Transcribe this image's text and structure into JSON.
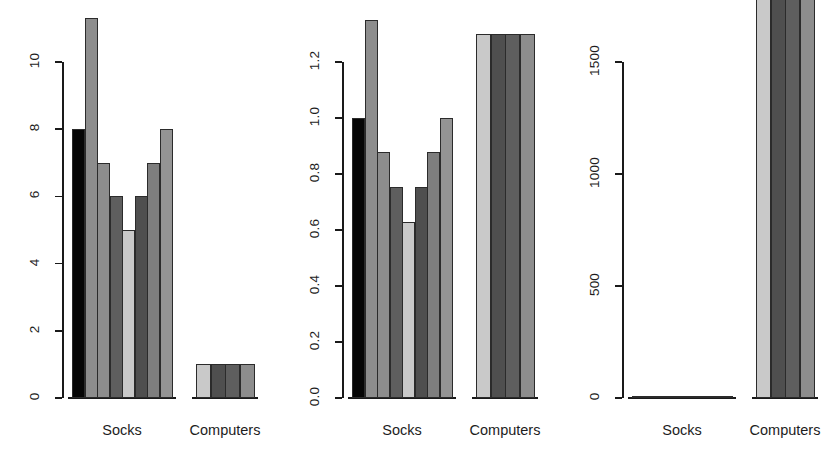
{
  "figure": {
    "type": "multi-panel-bar-chart",
    "panel_count": 3,
    "background": "#ffffff",
    "bar_border_color": "#2b2b2b",
    "axis_color": "#1a1a1a",
    "text_color": "#1d1d1d"
  },
  "categories": [
    "Socks",
    "Computers"
  ],
  "palette": {
    "black": "#060606",
    "gray_mid": "#8d8d8d",
    "gray_light": "#b9b9b9",
    "gray_dark": "#5e5e5e",
    "gray_pale": "#c9c9c9",
    "gray_darker": "#4f4f4f",
    "gray_medium2": "#7e7e7e",
    "gray_medium3": "#949494"
  },
  "chart_data": [
    {
      "id": "panel-1",
      "type": "bar",
      "title": "",
      "xlabel": "",
      "ylabel": "",
      "grid": false,
      "legend": "none",
      "ylim": [
        0,
        11.6
      ],
      "yticks": [
        0,
        2,
        4,
        6,
        8,
        10
      ],
      "ytick_labels": [
        "0",
        "2",
        "4",
        "6",
        "8",
        "10"
      ],
      "categories": [
        "Socks",
        "Computers"
      ],
      "groups": [
        {
          "category": "Socks",
          "values": [
            8,
            11.3,
            7,
            6,
            5,
            6,
            7,
            8
          ],
          "colors": [
            "#060606",
            "#8d8d8d",
            "#8d8d8d",
            "#5e5e5e",
            "#c9c9c9",
            "#4f4f4f",
            "#7e7e7e",
            "#949494"
          ]
        },
        {
          "category": "Computers",
          "values": [
            1,
            1,
            1,
            1
          ],
          "colors": [
            "#c9c9c9",
            "#4f4f4f",
            "#5e5e5e",
            "#8d8d8d"
          ]
        }
      ]
    },
    {
      "id": "panel-2",
      "type": "bar",
      "title": "",
      "xlabel": "",
      "ylabel": "",
      "grid": false,
      "legend": "none",
      "ylim": [
        0,
        1.38
      ],
      "yticks": [
        0.0,
        0.2,
        0.4,
        0.6,
        0.8,
        1.0,
        1.2
      ],
      "ytick_labels": [
        "0.0",
        "0.2",
        "0.4",
        "0.6",
        "0.8",
        "1.0",
        "1.2"
      ],
      "categories": [
        "Socks",
        "Computers"
      ],
      "groups": [
        {
          "category": "Socks",
          "values": [
            1.0,
            1.35,
            0.88,
            0.755,
            0.63,
            0.755,
            0.88,
            1.0
          ],
          "colors": [
            "#060606",
            "#8d8d8d",
            "#8d8d8d",
            "#5e5e5e",
            "#c9c9c9",
            "#4f4f4f",
            "#7e7e7e",
            "#949494"
          ]
        },
        {
          "category": "Computers",
          "values": [
            1.3,
            1.3,
            1.3,
            1.3
          ],
          "colors": [
            "#c9c9c9",
            "#4f4f4f",
            "#5e5e5e",
            "#8d8d8d"
          ]
        }
      ]
    },
    {
      "id": "panel-3",
      "type": "bar",
      "title": "",
      "xlabel": "",
      "ylabel": "",
      "grid": false,
      "legend": "none",
      "ylim": [
        0,
        1960
      ],
      "yticks": [
        0,
        500,
        1000,
        1500
      ],
      "ytick_labels": [
        "0",
        "500",
        "1000",
        "1500"
      ],
      "categories": [
        "Socks",
        "Computers"
      ],
      "groups": [
        {
          "category": "Socks",
          "values": [
            2,
            2,
            2,
            2,
            2,
            2,
            2,
            2
          ],
          "colors": [
            "#060606",
            "#8d8d8d",
            "#8d8d8d",
            "#5e5e5e",
            "#c9c9c9",
            "#4f4f4f",
            "#7e7e7e",
            "#949494"
          ]
        },
        {
          "category": "Computers",
          "values": [
            1900,
            1900,
            1900,
            1900
          ],
          "colors": [
            "#c9c9c9",
            "#4f4f4f",
            "#5e5e5e",
            "#8d8d8d"
          ]
        }
      ]
    }
  ],
  "layout": {
    "panel_width": 280,
    "panel_height": 461,
    "plot_bottom_y": 398,
    "plot_top_y": 14,
    "xlabel_y": 422,
    "axis_x": 62,
    "socks_group_left": 72,
    "socks_group_width": 100,
    "computers_group_left": 196,
    "computers_group_width": 58
  }
}
